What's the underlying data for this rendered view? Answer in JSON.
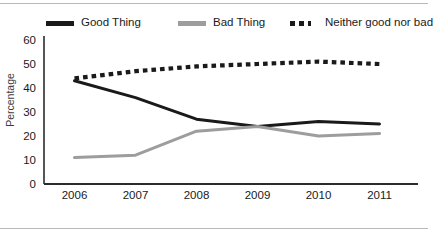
{
  "chart_data": {
    "type": "line",
    "title": "",
    "xlabel": "",
    "ylabel": "Percentage",
    "categories": [
      "2006",
      "2007",
      "2008",
      "2009",
      "2010",
      "2011"
    ],
    "ylim": [
      0,
      60
    ],
    "yticks": [
      0,
      10,
      20,
      30,
      40,
      50,
      60
    ],
    "grid": false,
    "legend_position": "top",
    "series": [
      {
        "name": "Good Thing",
        "color": "#1a1a1a",
        "style": "solid",
        "values": [
          43,
          36,
          27,
          24,
          26,
          25
        ]
      },
      {
        "name": "Bad Thing",
        "color": "#9d9d9d",
        "style": "solid",
        "values": [
          11,
          12,
          22,
          24,
          20,
          21
        ]
      },
      {
        "name": "Neither good nor bad",
        "color": "#1a1a1a",
        "style": "dotted",
        "values": [
          44,
          47,
          49,
          50,
          51,
          50
        ]
      }
    ]
  },
  "legend": {
    "good_label": "Good Thing",
    "bad_label": "Bad Thing",
    "neither_label": "Neither good nor bad"
  },
  "axis": {
    "y_title": "Percentage",
    "y_ticks": [
      "60",
      "50",
      "40",
      "30",
      "20",
      "10",
      "0"
    ],
    "x_ticks": [
      "2006",
      "2007",
      "2008",
      "2009",
      "2010",
      "2011"
    ]
  }
}
